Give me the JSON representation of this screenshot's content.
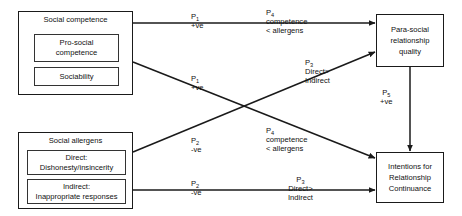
{
  "diagram": {
    "type": "conceptual-path-model",
    "boxes": {
      "social_competence": {
        "title": "Social competence",
        "sub_items": [
          {
            "line1": "Pro-social",
            "line2": "competence"
          },
          {
            "line1": "Sociability",
            "line2": ""
          }
        ]
      },
      "social_allergens": {
        "title": "Social allergens",
        "sub_items": [
          {
            "line1": "Direct:",
            "line2": "Dishonesty/insincerity"
          },
          {
            "line1": "Indirect:",
            "line2": "Inappropriate responses"
          }
        ]
      },
      "para_social": {
        "lines": [
          "Para-social",
          "relationship",
          "quality"
        ]
      },
      "intentions": {
        "lines": [
          "Intentions for",
          "Relationship",
          "Continuance"
        ]
      }
    },
    "path_labels": {
      "p1_top": {
        "code": "P",
        "sub": "1",
        "detail": "+ve",
        "detail2": ""
      },
      "p1_cross": {
        "code": "P",
        "sub": "1",
        "detail": "+ve",
        "detail2": ""
      },
      "p4_top": {
        "code": "P",
        "sub": "4",
        "detail": "competence",
        "detail2": "< allergens"
      },
      "p4_mid": {
        "code": "P",
        "sub": "4",
        "detail": "competence",
        "detail2": "< allergens"
      },
      "p2_cross": {
        "code": "P",
        "sub": "2",
        "detail": "-ve",
        "detail2": ""
      },
      "p2_bottom": {
        "code": "P",
        "sub": "2",
        "detail": "-ve",
        "detail2": ""
      },
      "p3_upper": {
        "code": "P",
        "sub": "3",
        "detail": "Direct>",
        "detail2": "Indirect"
      },
      "p3_lower": {
        "code": "P",
        "sub": "3",
        "detail": "Direct>",
        "detail2": "Indirect"
      },
      "p5_vertical": {
        "code": "P",
        "sub": "5",
        "detail": "+ve",
        "detail2": ""
      }
    },
    "colors": {
      "stroke": "#1a1a1a",
      "inner_stroke": "#333333",
      "text": "#111111",
      "background": "#ffffff"
    }
  }
}
